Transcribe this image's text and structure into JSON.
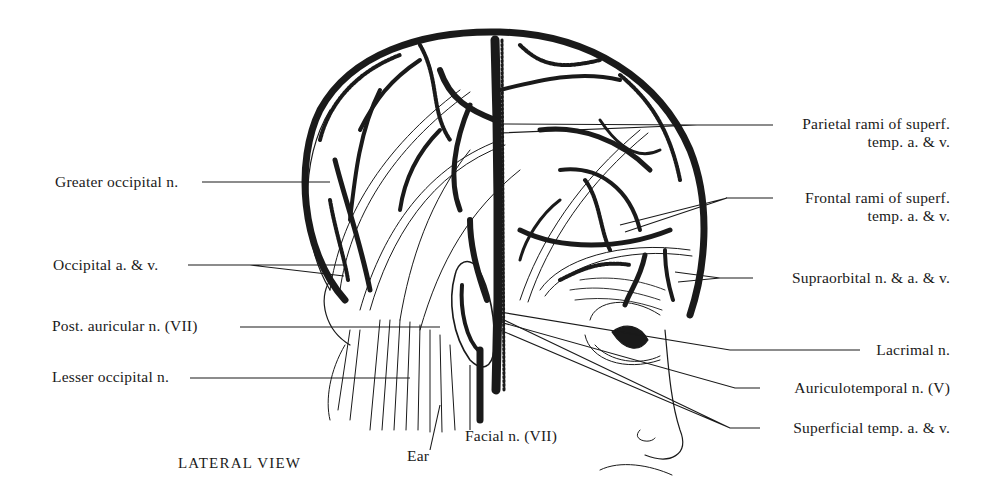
{
  "figure": {
    "caption": "LATERAL VIEW",
    "colors": {
      "ink": "#1a1a1a",
      "background": "#ffffff"
    }
  },
  "labels_left": [
    {
      "id": "greater-occipital-n",
      "text": "Greater occipital n."
    },
    {
      "id": "occipital-a-v",
      "text": "Occipital a. & v."
    },
    {
      "id": "post-auricular-n",
      "text": "Post. auricular n. (VII)"
    },
    {
      "id": "lesser-occipital-n",
      "text": "Lesser occipital n."
    }
  ],
  "labels_right": [
    {
      "id": "parietal-rami",
      "line1": "Parietal rami of superf.",
      "line2": "temp. a. & v."
    },
    {
      "id": "frontal-rami",
      "line1": "Frontal rami of superf.",
      "line2": "temp. a. & v."
    },
    {
      "id": "supraorbital",
      "text": "Supraorbital n. & a. & v."
    },
    {
      "id": "lacrimal-n",
      "text": "Lacrimal n."
    },
    {
      "id": "auriculotemporal-n",
      "text": "Auriculotemporal n. (V)"
    },
    {
      "id": "superficial-temp",
      "text": "Superficial temp. a. & v."
    }
  ],
  "labels_bottom": [
    {
      "id": "ear",
      "text": "Ear"
    },
    {
      "id": "facial-n",
      "text": "Facial n. (VII)"
    }
  ]
}
